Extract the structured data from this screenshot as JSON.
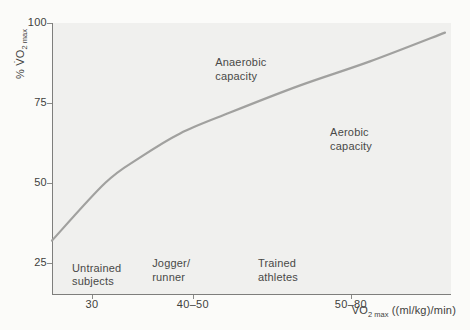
{
  "figure": {
    "background": "#fbfbf9",
    "plot_background": "#f0f0ee",
    "axis_color": "#7e7e7c",
    "curve_color": "#a1a19f",
    "text_color": "#494947"
  },
  "chart_data": {
    "type": "line",
    "title": "",
    "ylabel": "% V̇O2 max",
    "ylabel_parts": {
      "p1": "% V̇O",
      "sub": "2",
      "sub_word": " max"
    },
    "xlabel": "V̇O2 max ((ml/kg)/min)",
    "xlabel_parts": {
      "p1": "V̇O",
      "sub": "2",
      "sub_word": " max",
      "p2": " ((ml/kg)/min)"
    },
    "ylim": [
      15,
      100
    ],
    "y_ticks": [
      100,
      75,
      50,
      25
    ],
    "x_ticks": [
      {
        "label": "30",
        "frac": 0.1
      },
      {
        "label": "40–50",
        "frac": 0.353
      },
      {
        "label": "50–80",
        "frac": 0.749
      }
    ],
    "grid": false,
    "legend": false,
    "series": [
      {
        "name": "Percent of VO2 max sustainable vs maximal aerobic power",
        "points_frac_pct": [
          [
            0.0,
            32.0
          ],
          [
            0.133,
            50.0
          ],
          [
            0.221,
            58.0
          ],
          [
            0.321,
            65.5
          ],
          [
            0.446,
            72.0
          ],
          [
            0.622,
            80.5
          ],
          [
            0.797,
            88.0
          ],
          [
            0.985,
            97.0
          ]
        ]
      }
    ],
    "annotations": [
      {
        "text": "Anaerobic\ncapacity",
        "x_frac": 0.409,
        "y_frac": 0.122
      },
      {
        "text": "Aerobic\ncapacity",
        "x_frac": 0.697,
        "y_frac": 0.38
      },
      {
        "text": "Untrained\nsubjects",
        "x_frac": 0.05,
        "y_frac": 0.878
      },
      {
        "text": "Jogger/\nrunner",
        "x_frac": 0.251,
        "y_frac": 0.862
      },
      {
        "text": "Trained\nathletes",
        "x_frac": 0.516,
        "y_frac": 0.862
      }
    ]
  }
}
